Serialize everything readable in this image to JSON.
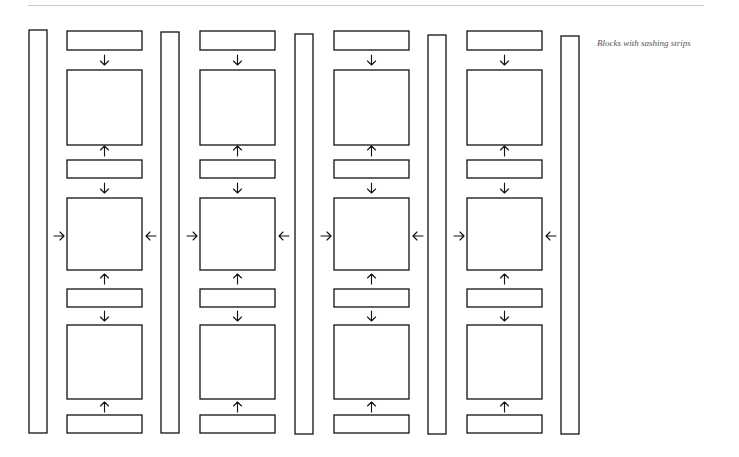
{
  "caption": "Blocks with sashing strips",
  "colors": {
    "stroke": "#111111",
    "background": "#ffffff",
    "rule": "#c8c8c8",
    "caption": "#555555"
  },
  "diagram": {
    "vertical_strips": [
      {
        "x": 29,
        "y": 30,
        "w": 18,
        "h": 403
      },
      {
        "x": 161,
        "y": 32,
        "w": 18,
        "h": 401
      },
      {
        "x": 295,
        "y": 34,
        "w": 18,
        "h": 400
      },
      {
        "x": 428,
        "y": 35,
        "w": 18,
        "h": 399
      },
      {
        "x": 561,
        "y": 36,
        "w": 18,
        "h": 398
      }
    ],
    "columns": [
      {
        "x": 67,
        "w": 75
      },
      {
        "x": 200,
        "w": 75
      },
      {
        "x": 334,
        "w": 75
      },
      {
        "x": 467,
        "w": 75
      }
    ],
    "horizontal_strips_y": [
      {
        "y": 31,
        "h": 19
      },
      {
        "y": 160,
        "h": 18
      },
      {
        "y": 289,
        "h": 18
      },
      {
        "y": 415,
        "h": 18
      }
    ],
    "blocks_y": [
      {
        "y": 70,
        "h": 75
      },
      {
        "y": 198,
        "h": 72
      },
      {
        "y": 325,
        "h": 74
      }
    ],
    "arrows_vertical": [
      {
        "y": 60,
        "dir": "down"
      },
      {
        "y": 151,
        "dir": "up"
      },
      {
        "y": 188,
        "dir": "down"
      },
      {
        "y": 279,
        "dir": "up"
      },
      {
        "y": 316,
        "dir": "down"
      },
      {
        "y": 407,
        "dir": "up"
      }
    ],
    "arrows_horizontal_y": 236
  }
}
